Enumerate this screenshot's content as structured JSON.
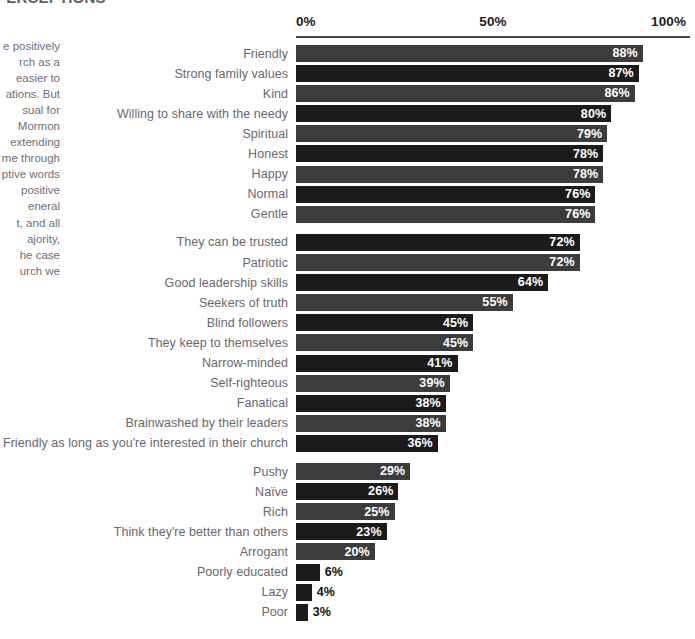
{
  "heading": {
    "clipped_text": "PERCEPTIONS"
  },
  "side_text": {
    "paragraph": "e positively\nrch as a\neasier to\nations.  But\nsual for\nMormon\nextending\nme through\nptive words\npositive\neneral\nt, and all\najority,\nhe case\nurch we"
  },
  "axis": {
    "ticks": [
      "0%",
      "50%",
      "100%"
    ]
  },
  "colors": {
    "bar_dark": "#1b1b1b",
    "bar_light": "#3c3c3c",
    "label_gray": "#67676f",
    "value_white": "#ffffff",
    "value_dark": "#101010",
    "axis_rule": "#4a4a4a"
  },
  "chart_data": {
    "type": "bar",
    "orientation": "horizontal",
    "title": "",
    "subtitle": "",
    "xlabel": "",
    "ylabel": "",
    "xlim": [
      0,
      100
    ],
    "grid": false,
    "legend": null,
    "value_suffix": "%",
    "categories": [
      "Friendly",
      "Strong family values",
      "Kind",
      "Willing to share with the needy",
      "Spiritual",
      "Honest",
      "Happy",
      "Normal",
      "Gentle",
      "They can be trusted",
      "Patriotic",
      "Good leadership skills",
      "Seekers of truth",
      "Blind followers",
      "They keep to themselves",
      "Narrow-minded",
      "Self-righteous",
      "Fanatical",
      "Brainwashed by their leaders",
      "Friendly as long as you're interested in their church",
      "Pushy",
      "Naïve",
      "Rich",
      "Think they're better than others",
      "Arrogant",
      "Poorly educated",
      "Lazy",
      "Poor"
    ],
    "values": [
      88,
      87,
      86,
      80,
      79,
      78,
      78,
      76,
      76,
      72,
      72,
      64,
      55,
      45,
      45,
      41,
      39,
      38,
      38,
      36,
      29,
      26,
      25,
      23,
      20,
      6,
      4,
      3
    ],
    "value_labels": [
      "88%",
      "87%",
      "86%",
      "80%",
      "79%",
      "78%",
      "78%",
      "76%",
      "76%",
      "72%",
      "72%",
      "64%",
      "55%",
      "45%",
      "45%",
      "41%",
      "39%",
      "38%",
      "38%",
      "36%",
      "29%",
      "26%",
      "25%",
      "23%",
      "20%",
      "6%",
      "4%",
      "3%"
    ],
    "bar_shades": [
      "light",
      "dark",
      "light",
      "dark",
      "light",
      "dark",
      "light",
      "dark",
      "light",
      "dark",
      "light",
      "dark",
      "light",
      "dark",
      "light",
      "dark",
      "light",
      "dark",
      "light",
      "dark",
      "light",
      "dark",
      "light",
      "dark",
      "light",
      "dark",
      "dark",
      "dark"
    ],
    "label_inside": [
      true,
      true,
      true,
      true,
      true,
      true,
      true,
      true,
      true,
      true,
      true,
      true,
      true,
      true,
      true,
      true,
      true,
      true,
      true,
      true,
      true,
      true,
      true,
      true,
      true,
      false,
      false,
      false
    ],
    "group_breaks_after": [
      8,
      19
    ]
  }
}
